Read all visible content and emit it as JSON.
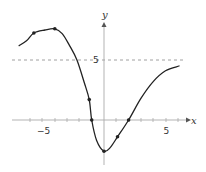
{
  "chart_data": {
    "type": "line",
    "title": "",
    "xlabel": "x",
    "ylabel": "y",
    "xlim": [
      -7.5,
      7
    ],
    "ylim": [
      -3.5,
      8.5
    ],
    "grid": false,
    "legend": null,
    "x_ticks": [
      -5,
      0,
      5
    ],
    "x_tick_labels": [
      "−5",
      "5"
    ],
    "y_tick_labels": [
      "5"
    ],
    "reference_lines": [
      {
        "type": "horizontal",
        "y": 5,
        "style": "dashed",
        "color": "#888888"
      }
    ],
    "series": [
      {
        "name": "f(x)",
        "color": "#222222",
        "curve": [
          [
            -6.9,
            6.2
          ],
          [
            -6.3,
            6.6
          ],
          [
            -5.7,
            7.25
          ],
          [
            -4.8,
            7.5
          ],
          [
            -4.0,
            7.6
          ],
          [
            -3.4,
            7.2
          ],
          [
            -2.8,
            6.2
          ],
          [
            -2.2,
            5.0
          ],
          [
            -1.6,
            3.1
          ],
          [
            -1.2,
            1.7
          ],
          [
            -1.0,
            0.0
          ],
          [
            -0.6,
            -1.7
          ],
          [
            0.0,
            -2.6
          ],
          [
            0.5,
            -2.3
          ],
          [
            1.1,
            -1.4
          ],
          [
            2.0,
            0.0
          ],
          [
            3.0,
            1.8
          ],
          [
            4.0,
            3.2
          ],
          [
            5.0,
            4.1
          ],
          [
            6.1,
            4.5
          ]
        ],
        "marked_points": [
          [
            -5.7,
            7.25
          ],
          [
            -4.0,
            7.6
          ],
          [
            -1.2,
            1.7
          ],
          [
            -1.0,
            0.0
          ],
          [
            0.0,
            -2.6
          ],
          [
            1.1,
            -1.4
          ],
          [
            2.0,
            0.0
          ]
        ]
      }
    ]
  },
  "labels": {
    "x_axis": "x",
    "y_axis": "y",
    "x_tick_neg5": "−5",
    "x_tick_5": "5",
    "y_tick_5": "5"
  },
  "colors": {
    "axis": "#aaaaaa",
    "curve": "#222222",
    "dashed": "#888888",
    "text": "#333333"
  }
}
